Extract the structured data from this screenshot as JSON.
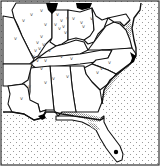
{
  "map": {
    "region": "Southeastern United States",
    "legend_categories": [
      {
        "name": "dense",
        "pattern": "solid-black"
      },
      {
        "name": "common",
        "pattern": "gray-stipple"
      },
      {
        "name": "scattered-records",
        "pattern": "v-mark"
      },
      {
        "name": "ocean",
        "pattern": "dot-pattern"
      }
    ],
    "colors": {
      "border": "#111111",
      "land": "#ffffff",
      "dense": "#000000",
      "stipple": "#9a9a9a",
      "ocean_dot": "#888888"
    },
    "mark_glyph": "v",
    "states": [
      "Illinois",
      "Indiana",
      "Ohio",
      "Kentucky",
      "West Virginia",
      "Virginia",
      "Maryland",
      "Delaware",
      "Missouri",
      "Tennessee",
      "North Carolina",
      "South Carolina",
      "Georgia",
      "Alabama",
      "Mississippi",
      "Louisiana",
      "Arkansas",
      "Florida"
    ],
    "dense_areas": [
      "northern Illinois (Lake Michigan shore)",
      "northwest Ohio (Lake Erie shore)",
      "coastal North Carolina",
      "Lake Okeechobee area, Florida",
      "Mississippi River delta"
    ],
    "stippled_areas": [
      "eastern North Carolina coastal plain",
      "South Carolina coast",
      "Georgia coast",
      "Florida panhandle / Gulf coast",
      "Chesapeake Bay",
      "southern Illinois confluence"
    ]
  }
}
